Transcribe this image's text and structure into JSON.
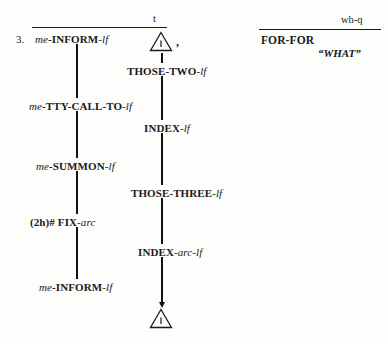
{
  "document": {
    "type": "asl-gloss-transcription",
    "example_number": "3."
  },
  "nonmanual_markers": {
    "topic": {
      "tag": "t"
    },
    "wh_question": {
      "tag": "wh-q"
    }
  },
  "left_column": {
    "glosses": [
      {
        "prefix": "me",
        "root": "INFORM",
        "suffix": "lf"
      },
      {
        "prefix": "me",
        "root": "TTY-CALL-TO",
        "suffix": "lf"
      },
      {
        "prefix": "me",
        "root": "SUMMON",
        "suffix": "lf"
      },
      {
        "prefix": "(2h)#",
        "root": "FIX",
        "suffix": "arc"
      },
      {
        "prefix": "me",
        "root": "INFORM",
        "suffix": "lf"
      }
    ],
    "text": [
      "me-INFORM-lf",
      "me-TTY-CALL-TO-lf",
      "me-SUMMON-lf",
      "(2h)# FIX-arc",
      "me-INFORM-lf"
    ]
  },
  "center_column": {
    "glosses": [
      {
        "prefix": "",
        "root": "THOSE-TWO",
        "suffix": "lf"
      },
      {
        "prefix": "",
        "root": "INDEX",
        "suffix": "lf"
      },
      {
        "prefix": "",
        "root": "THOSE-THREE",
        "suffix": "lf"
      },
      {
        "prefix": "",
        "root": "INDEX",
        "suffix": "arc-lf"
      }
    ],
    "text": [
      "THOSE-TWO-lf",
      "INDEX-lf",
      "THOSE-THREE-lf",
      "INDEX-arc-lf"
    ]
  },
  "right_column": {
    "sign": "FOR-FOR",
    "translation": "“WHAT”"
  },
  "punctuation": {
    "comma": ","
  },
  "icons": {
    "classifier_triangle_top": "triangle-classifier-icon",
    "classifier_triangle_bottom": "triangle-classifier-icon",
    "arrow_down": "arrow-down-icon"
  },
  "colors": {
    "ink": "#1a1a1a",
    "line": "#111111",
    "paper": "#fdfdfc"
  }
}
